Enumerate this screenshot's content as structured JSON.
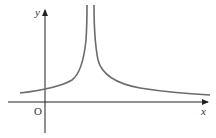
{
  "figure": {
    "x_axis_label": "x",
    "y_axis_label": "y",
    "origin_label": "O",
    "curve_color": "#6b6b6b",
    "axis_color": "#222222"
  }
}
